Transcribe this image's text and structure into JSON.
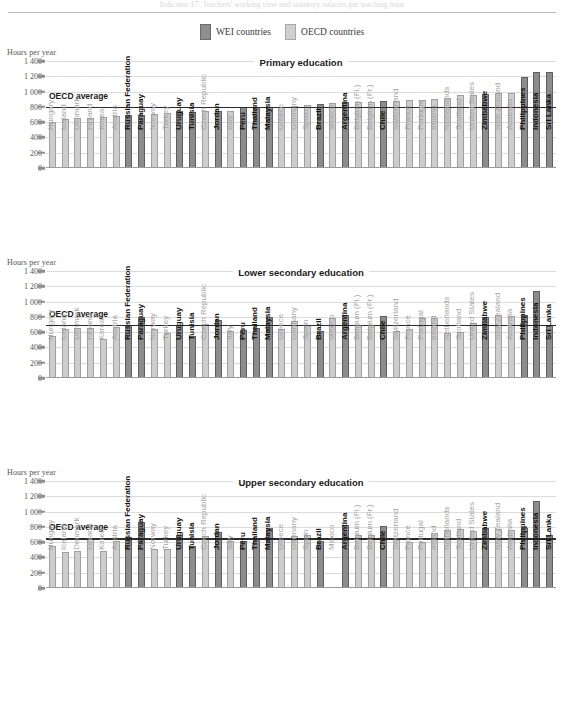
{
  "page": {
    "cut_top_text": "Indicator 17: Teachers' working time and statutory salaries per teaching hour",
    "y_axis_label": "Hours per year"
  },
  "legend": {
    "items": [
      {
        "label": "WEI countries",
        "group": "wei",
        "color": "#8c8c8c"
      },
      {
        "label": "OECD countries",
        "group": "oecd",
        "color": "#cdcdcd"
      }
    ]
  },
  "axis": {
    "ticks": [
      "1 400",
      "1 200",
      "1 000",
      "800",
      "600",
      "400",
      "200",
      "0"
    ],
    "tick_values": [
      1400,
      1200,
      1000,
      800,
      600,
      400,
      200,
      0
    ],
    "ymin": 0,
    "ymax": 1400
  },
  "countries": [
    {
      "name": "Hungary",
      "group": "oecd"
    },
    {
      "name": "Iceland",
      "group": "oecd"
    },
    {
      "name": "Denmark",
      "group": "oecd"
    },
    {
      "name": "Finland",
      "group": "oecd"
    },
    {
      "name": "Korea",
      "group": "oecd"
    },
    {
      "name": "Austria",
      "group": "oecd"
    },
    {
      "name": "Russian Federation",
      "group": "wei"
    },
    {
      "name": "Paraguay",
      "group": "wei"
    },
    {
      "name": "Norway",
      "group": "oecd"
    },
    {
      "name": "Turkey",
      "group": "oecd"
    },
    {
      "name": "Uruguay",
      "group": "wei"
    },
    {
      "name": "Tunisia",
      "group": "wei"
    },
    {
      "name": "Czech Republic",
      "group": "oecd"
    },
    {
      "name": "Jordan",
      "group": "wei"
    },
    {
      "name": "Italy",
      "group": "oecd"
    },
    {
      "name": "Peru",
      "group": "wei"
    },
    {
      "name": "Thailand",
      "group": "wei"
    },
    {
      "name": "Malaysia",
      "group": "wei"
    },
    {
      "name": "Greece",
      "group": "oecd"
    },
    {
      "name": "Germany",
      "group": "oecd"
    },
    {
      "name": "Spain",
      "group": "oecd"
    },
    {
      "name": "Brazil",
      "group": "wei"
    },
    {
      "name": "Mexico",
      "group": "oecd"
    },
    {
      "name": "Argentina",
      "group": "wei"
    },
    {
      "name": "Belgium (Fl.)",
      "group": "oecd"
    },
    {
      "name": "Belgium (Fr.)",
      "group": "oecd"
    },
    {
      "name": "Chile",
      "group": "wei"
    },
    {
      "name": "Switzerland",
      "group": "oecd"
    },
    {
      "name": "France",
      "group": "oecd"
    },
    {
      "name": "Portugal",
      "group": "oecd"
    },
    {
      "name": "Ireland",
      "group": "oecd"
    },
    {
      "name": "Netherlands",
      "group": "oecd"
    },
    {
      "name": "Scotland",
      "group": "oecd"
    },
    {
      "name": "United States",
      "group": "oecd"
    },
    {
      "name": "Zimbabwe",
      "group": "wei"
    },
    {
      "name": "New Zealand",
      "group": "oecd"
    },
    {
      "name": "Australia",
      "group": "oecd"
    },
    {
      "name": "Philippines",
      "group": "wei"
    },
    {
      "name": "Indonesia",
      "group": "wei"
    },
    {
      "name": "Sri Lanka",
      "group": "wei"
    }
  ],
  "chart_data": [
    {
      "type": "bar",
      "title": "Primary education",
      "xlabel": "",
      "ylabel": "Hours per year",
      "ylim": [
        0,
        1400
      ],
      "grid": true,
      "legend_position": "top-center",
      "average_line": {
        "label": "OECD average",
        "value": 800
      },
      "categories": [
        "Hungary",
        "Iceland",
        "Denmark",
        "Finland",
        "Korea",
        "Austria",
        "Russian Federation",
        "Paraguay",
        "Norway",
        "Turkey",
        "Uruguay",
        "Tunisia",
        "Czech Republic",
        "Jordan",
        "Italy",
        "Peru",
        "Thailand",
        "Malaysia",
        "Greece",
        "Germany",
        "Spain",
        "Brazil",
        "Mexico",
        "Argentina",
        "Belgium (Fl.)",
        "Belgium (Fr.)",
        "Chile",
        "Switzerland",
        "France",
        "Portugal",
        "Ireland",
        "Netherlands",
        "Scotland",
        "United States",
        "Zimbabwe",
        "New Zealand",
        "Australia",
        "Philippines",
        "Indonesia",
        "Sri Lanka"
      ],
      "values": [
        600,
        640,
        650,
        655,
        670,
        685,
        690,
        700,
        710,
        725,
        740,
        735,
        740,
        750,
        748,
        795,
        795,
        795,
        800,
        810,
        825,
        835,
        850,
        860,
        865,
        870,
        875,
        880,
        885,
        890,
        900,
        910,
        950,
        955,
        965,
        975,
        985,
        1190,
        1260,
        1260
      ],
      "groups": [
        "oecd",
        "oecd",
        "oecd",
        "oecd",
        "oecd",
        "oecd",
        "wei",
        "wei",
        "oecd",
        "oecd",
        "wei",
        "wei",
        "oecd",
        "wei",
        "oecd",
        "wei",
        "wei",
        "wei",
        "oecd",
        "oecd",
        "oecd",
        "wei",
        "oecd",
        "wei",
        "oecd",
        "oecd",
        "wei",
        "oecd",
        "oecd",
        "oecd",
        "oecd",
        "oecd",
        "oecd",
        "oecd",
        "wei",
        "oecd",
        "oecd",
        "wei",
        "wei",
        "wei"
      ]
    },
    {
      "type": "bar",
      "title": "Lower secondary education",
      "xlabel": "",
      "ylabel": "Hours per year",
      "ylim": [
        0,
        1400
      ],
      "grid": true,
      "legend_position": "top-center",
      "average_line": {
        "label": "OECD average",
        "value": 700
      },
      "categories": [
        "Hungary",
        "Iceland",
        "Denmark",
        "Finland",
        "Korea",
        "Austria",
        "Russian Federation",
        "Paraguay",
        "Norway",
        "Turkey",
        "Uruguay",
        "Tunisia",
        "Czech Republic",
        "Jordan",
        "Italy",
        "Peru",
        "Thailand",
        "Malaysia",
        "Greece",
        "Germany",
        "Spain",
        "Brazil",
        "Mexico",
        "Argentina",
        "Belgium (Fl.)",
        "Belgium (Fr.)",
        "Chile",
        "Switzerland",
        "France",
        "Portugal",
        "Ireland",
        "Netherlands",
        "Scotland",
        "United States",
        "Zimbabwe",
        "New Zealand",
        "Australia",
        "Philippines",
        "Indonesia",
        "Sri Lanka"
      ],
      "values": [
        555,
        640,
        650,
        655,
        505,
        665,
        695,
        795,
        635,
        585,
        700,
        550,
        705,
        755,
        615,
        625,
        655,
        795,
        640,
        740,
        700,
        615,
        790,
        830,
        690,
        690,
        805,
        620,
        640,
        790,
        790,
        585,
        600,
        720,
        800,
        830,
        815,
        825,
        1140,
        700,
        1235
      ],
      "groups": [
        "oecd",
        "oecd",
        "oecd",
        "oecd",
        "oecd",
        "oecd",
        "wei",
        "wei",
        "oecd",
        "oecd",
        "wei",
        "wei",
        "oecd",
        "wei",
        "oecd",
        "wei",
        "wei",
        "wei",
        "oecd",
        "oecd",
        "oecd",
        "wei",
        "oecd",
        "wei",
        "oecd",
        "oecd",
        "wei",
        "oecd",
        "oecd",
        "oecd",
        "oecd",
        "oecd",
        "oecd",
        "oecd",
        "wei",
        "oecd",
        "oecd",
        "wei",
        "wei",
        "wei"
      ]
    },
    {
      "type": "bar",
      "title": "Upper secondary education",
      "xlabel": "",
      "ylabel": "Hours per year",
      "ylim": [
        0,
        1400
      ],
      "grid": true,
      "legend_position": "top-center",
      "average_line": {
        "label": "OECD average",
        "value": 650
      },
      "categories": [
        "Hungary",
        "Iceland",
        "Denmark",
        "Finland",
        "Korea",
        "Austria",
        "Russian Federation",
        "Paraguay",
        "Norway",
        "Turkey",
        "Uruguay",
        "Tunisia",
        "Czech Republic",
        "Jordan",
        "Italy",
        "Peru",
        "Thailand",
        "Malaysia",
        "Greece",
        "Germany",
        "Spain",
        "Brazil",
        "Mexico",
        "Argentina",
        "Belgium (Fl.)",
        "Belgium (Fr.)",
        "Chile",
        "Switzerland",
        "France",
        "Portugal",
        "Ireland",
        "Netherlands",
        "Scotland",
        "United States",
        "Zimbabwe",
        "New Zealand",
        "Australia",
        "Philippines",
        "Indonesia",
        "Sri Lanka"
      ],
      "values": [
        550,
        465,
        490,
        635,
        490,
        615,
        670,
        860,
        505,
        505,
        700,
        550,
        675,
        730,
        620,
        620,
        635,
        790,
        635,
        675,
        700,
        615,
        0,
        830,
        690,
        690,
        805,
        660,
        600,
        600,
        715,
        760,
        770,
        740,
        790,
        770,
        760,
        790,
        1140,
        690,
        1235
      ],
      "groups": [
        "oecd",
        "oecd",
        "oecd",
        "oecd",
        "oecd",
        "oecd",
        "wei",
        "wei",
        "oecd",
        "oecd",
        "wei",
        "wei",
        "oecd",
        "wei",
        "oecd",
        "wei",
        "wei",
        "wei",
        "oecd",
        "oecd",
        "oecd",
        "wei",
        "oecd",
        "wei",
        "oecd",
        "oecd",
        "wei",
        "oecd",
        "oecd",
        "oecd",
        "oecd",
        "oecd",
        "oecd",
        "oecd",
        "wei",
        "oecd",
        "oecd",
        "wei",
        "wei",
        "wei"
      ]
    }
  ]
}
